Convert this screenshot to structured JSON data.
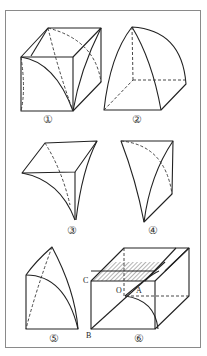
{
  "figure": {
    "frame": "bordered-panel",
    "panels": [
      {
        "id": 1,
        "label": "①",
        "description": "cube with intersecting cylindrical arcs (groin vault)"
      },
      {
        "id": 2,
        "label": "②",
        "description": "quarter-dome solid over square base"
      },
      {
        "id": 3,
        "label": "③",
        "description": "inverted cusp solid with square top face"
      },
      {
        "id": 4,
        "label": "④",
        "description": "curved triangular wedge"
      },
      {
        "id": 5,
        "label": "⑤",
        "description": "segment with curved edges on rectangular face"
      },
      {
        "id": 6,
        "label": "⑥",
        "description": "box with hatched cross-section strips and inscribed arcs"
      }
    ],
    "points": {
      "C": "C",
      "O": "O",
      "A": "A",
      "B": "B"
    },
    "colors": {
      "line": "#222222",
      "frame": "#8a8a8a",
      "hatch": "#444444",
      "background": "#ffffff"
    }
  }
}
